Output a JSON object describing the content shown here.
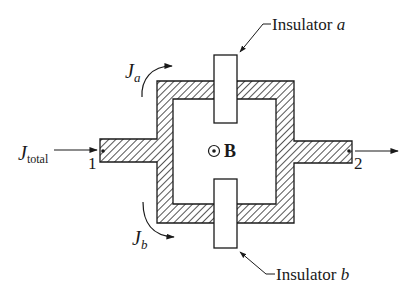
{
  "diagram": {
    "type": "circuit-conductor-loop",
    "colors": {
      "ink": "#1a1a1a",
      "hatch": "#555555",
      "background": "#ffffff"
    },
    "labels": {
      "j_total_main": "J",
      "j_total_sub": "total",
      "j_a_main": "J",
      "j_a_sub": "a",
      "j_b_main": "J",
      "j_b_sub": "b",
      "node_1": "1",
      "node_2": "2",
      "b_field": "B",
      "insulator_a_prefix": "Insulator ",
      "insulator_a_letter": "a",
      "insulator_b_prefix": "Insulator ",
      "insulator_b_letter": "b"
    },
    "nodes": [
      {
        "id": "1",
        "label": "1",
        "position": "left lead end"
      },
      {
        "id": "2",
        "label": "2",
        "position": "right lead end"
      }
    ],
    "components": [
      {
        "id": "insulator-a",
        "label": "Insulator a",
        "position": "top branch"
      },
      {
        "id": "insulator-b",
        "label": "Insulator b",
        "position": "bottom branch"
      }
    ],
    "field": {
      "symbol": "⊙",
      "label": "B",
      "direction": "out of page"
    },
    "currents": [
      {
        "label": "J_total",
        "direction": "into node 1"
      },
      {
        "label": "J_a",
        "direction": "upper branch"
      },
      {
        "label": "J_b",
        "direction": "lower branch"
      }
    ]
  }
}
